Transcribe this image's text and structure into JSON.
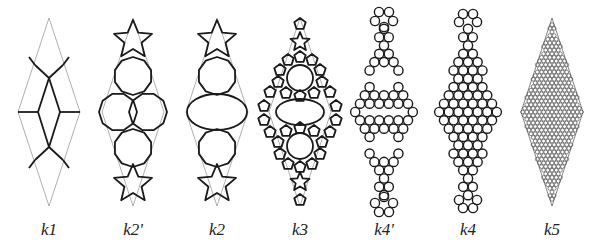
{
  "figure": {
    "background": "#ffffff",
    "line_color": "#1a1a1a",
    "outline_color": "#9a9a9a",
    "panels": [
      {
        "id": "k1",
        "label": "k1",
        "cx": 49,
        "type": "rhombus-graph"
      },
      {
        "id": "k2p",
        "label": "k2'",
        "cx": 133,
        "type": "decagons-overlapping"
      },
      {
        "id": "k2",
        "label": "k2",
        "cx": 217,
        "type": "decagons-stacked"
      },
      {
        "id": "k3",
        "label": "k3",
        "cx": 300,
        "type": "pentagon-ring"
      },
      {
        "id": "k4p",
        "label": "k4'",
        "cx": 384,
        "type": "circle-packing-sparse"
      },
      {
        "id": "k4",
        "label": "k4",
        "cx": 468,
        "type": "circle-packing-dense"
      },
      {
        "id": "k5",
        "label": "k5",
        "cx": 552,
        "type": "fine-packing"
      }
    ],
    "rhombus": {
      "top": 18,
      "bottom": 206,
      "half_width": 31
    }
  }
}
